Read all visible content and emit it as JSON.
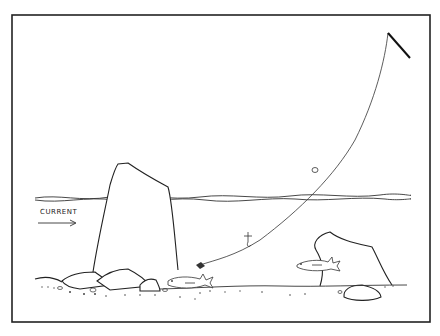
{
  "illustration": {
    "subject": "fishing line drifting with current over rocks to fish near bottom",
    "labels": {
      "current": "CURRENT"
    },
    "colors": {
      "ink": "#222222",
      "background": "#ffffff"
    }
  }
}
